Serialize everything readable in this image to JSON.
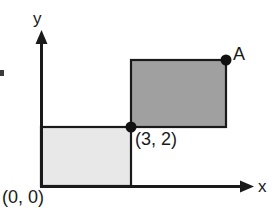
{
  "figure": {
    "background_color": "#ffffff",
    "stroke_color": "#1a1a1a"
  },
  "axes": {
    "x_axis": {
      "label": "x",
      "icon": "arrow-right-icon",
      "start_px": [
        41,
        186
      ],
      "end_px": [
        253,
        186
      ]
    },
    "y_axis": {
      "label": "y",
      "icon": "arrow-up-icon",
      "start_px": [
        41,
        186
      ],
      "end_px": [
        41,
        32
      ]
    },
    "origin_label": "(0, 0)"
  },
  "shapes": [
    {
      "name": "lower-left-rectangle",
      "fill": "#e8e8e8",
      "stroke": "#1a1a1a",
      "x_px": 41,
      "y_px": 127,
      "width_px": 90,
      "height_px": 59,
      "corner_from": "(0, 0)",
      "corner_to": "(3, 2)"
    },
    {
      "name": "upper-right-rectangle",
      "fill": "#a0a0a0",
      "stroke": "#1a1a1a",
      "x_px": 131,
      "y_px": 60,
      "width_px": 95,
      "height_px": 67,
      "corner_from": "(3, 2)",
      "corner_to": "A"
    }
  ],
  "points": [
    {
      "name": "point-3-2",
      "label": "(3, 2)",
      "x_px": 131,
      "y_px": 127,
      "radius_px": 5.5,
      "color": "#111111"
    },
    {
      "name": "point-A",
      "label": "A",
      "x_px": 226,
      "y_px": 60,
      "radius_px": 5.5,
      "color": "#111111"
    }
  ],
  "artifacts": [
    {
      "name": "scan-edge-mark",
      "x_px": 0,
      "y_px": 70,
      "width_px": 4,
      "height_px": 6
    }
  ],
  "chart_data": {
    "type": "scatter",
    "title": "",
    "xlabel": "x",
    "ylabel": "y",
    "annotations": [
      "(0, 0)",
      "(3, 2)",
      "A"
    ],
    "points": [
      {
        "label": "(0, 0)",
        "x": 0,
        "y": 0
      },
      {
        "label": "(3, 2)",
        "x": 3,
        "y": 2
      },
      {
        "label": "A",
        "x": 6.2,
        "y": 4.3
      }
    ],
    "rectangles": [
      {
        "name": "lower-left-rectangle",
        "x0": 0,
        "y0": 0,
        "x1": 3,
        "y1": 2,
        "fill": "#e8e8e8"
      },
      {
        "name": "upper-right-rectangle",
        "x0": 3,
        "y0": 2,
        "x1": 6.2,
        "y1": 4.3,
        "fill": "#a0a0a0"
      }
    ],
    "grid": false,
    "legend": "none",
    "xlim": [
      0,
      7.1
    ],
    "ylim": [
      0,
      5.2
    ]
  }
}
